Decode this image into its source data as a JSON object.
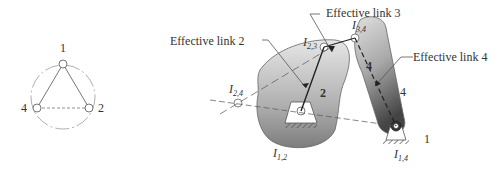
{
  "linear_graph": {
    "nodes": [
      {
        "id": "1",
        "label": "1"
      },
      {
        "id": "2",
        "label": "2"
      },
      {
        "id": "4",
        "label": "4"
      }
    ],
    "edges": [
      {
        "from": "1",
        "to": "2",
        "style": "solid"
      },
      {
        "from": "1",
        "to": "4",
        "style": "solid"
      },
      {
        "from": "2",
        "to": "4",
        "style": "dashed"
      }
    ]
  },
  "mechanism": {
    "callouts": {
      "effective_link_2": "Effective link 2",
      "effective_link_3": "Effective link 3",
      "effective_link_4": "Effective link 4"
    },
    "link_labels": {
      "link2": "2",
      "link4_upper": "4",
      "link4_lower": "4",
      "ground": "1"
    },
    "instant_centers": {
      "i12": {
        "main": "I",
        "sub": "1,2"
      },
      "i14": {
        "main": "I",
        "sub": "1,4"
      },
      "i23": {
        "main": "I",
        "sub": "2,3"
      },
      "i34": {
        "main": "I",
        "sub": "3,4"
      },
      "i24": {
        "main": "I",
        "sub": "2,4"
      }
    },
    "colors": {
      "link_light": "#d8d8d8",
      "link_dark": "#7a7a7a",
      "line": "#555555"
    }
  }
}
